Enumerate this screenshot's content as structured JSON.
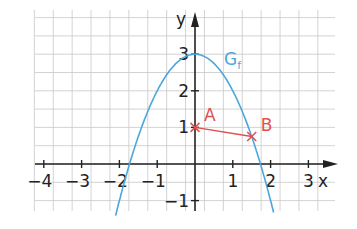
{
  "chart_data": {
    "type": "line",
    "title": "",
    "function_label": "G",
    "function_subscript": "f",
    "function": "f(x) = -x^2 + 3",
    "xlabel": "x",
    "ylabel": "y",
    "xlim": [
      -4.25,
      3.6
    ],
    "ylim": [
      -1.25,
      3.8
    ],
    "grid": true,
    "grid_step": 0.5,
    "x_ticks": [
      -4,
      -3,
      -2,
      -1,
      1,
      2,
      3
    ],
    "x_tick_labels": [
      "−4",
      "−3",
      "−2",
      "−1",
      "1",
      "2",
      "3"
    ],
    "y_ticks": [
      -1,
      1,
      2,
      3
    ],
    "y_tick_labels": [
      "−1",
      "1",
      "2",
      "3"
    ],
    "points": [
      {
        "name": "A",
        "x": 0,
        "y": 1
      },
      {
        "name": "B",
        "x": 1.5,
        "y": 0.75
      }
    ],
    "segments": [
      {
        "from": "A",
        "to": "B"
      }
    ],
    "colors": {
      "curve": "#4aa6dc",
      "points": "#e0504f",
      "axes": "#222222",
      "grid": "#c8c8c8"
    }
  }
}
